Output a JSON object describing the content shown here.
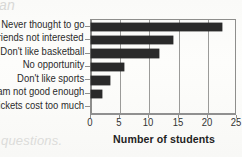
{
  "artifacts": {
    "top_left_text": "an",
    "bottom_left_text": "questions."
  },
  "colors": {
    "background": "#fbfbf9",
    "bar": "#2a2a2a",
    "axis": "#8e8e8c",
    "gridline": "#9b9b99",
    "label_text": "#2b2b2b",
    "artifact_text": "#d8d8d6"
  },
  "chart_data": {
    "type": "bar",
    "orientation": "horizontal",
    "title": "",
    "subtitle": "",
    "xlabel": "Number of students",
    "ylabel": "",
    "categories": [
      "Never thought to go",
      "Friends not interested",
      "Don't like basketball",
      "No opportunity",
      "Don't like sports",
      "Team not good enough",
      "Tickets cost too much"
    ],
    "values": [
      22.5,
      14,
      11.7,
      5.7,
      3.3,
      1.8,
      0
    ],
    "xlim": [
      0,
      25
    ],
    "xticks": [
      0,
      5,
      10,
      15,
      20,
      25
    ],
    "xticklabels": [
      "0",
      "5",
      "10",
      "15",
      "20",
      "25"
    ],
    "grid": "vertical",
    "legend": null,
    "legend_position": "none",
    "bar_color": "#2a2a2a"
  }
}
